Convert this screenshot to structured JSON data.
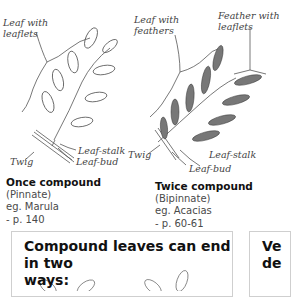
{
  "left_figure": {
    "labels": {
      "leaf_with": "Leaf with",
      "leaflets": "leaflets",
      "leaf_stalk": "Leaf-stalk",
      "twig": "Twig",
      "leaf_bud": "Leaf-bud"
    },
    "caption": {
      "title": "Once compound",
      "subtitle": "(Pinnate)",
      "example": "eg. Marula",
      "page": "- p. 140"
    }
  },
  "right_figure": {
    "labels": {
      "leaf_with": "Leaf with",
      "feathers": "feathers",
      "feather_with": "Feather with",
      "leaflets": "leaflets",
      "twig": "Twig",
      "leaf_stalk": "Leaf-stalk",
      "leaf_bud": "Leaf-bud"
    },
    "caption": {
      "title": "Twice compound",
      "subtitle": "(Bipinnate)",
      "example": "eg. Acacias",
      "page": "- p. 60-61"
    }
  },
  "info_box": {
    "heading_line1": "Compound leaves can end in two",
    "heading_line2": "ways:"
  },
  "side_box": {
    "heading_line1": "Ve",
    "heading_line2": "de"
  }
}
